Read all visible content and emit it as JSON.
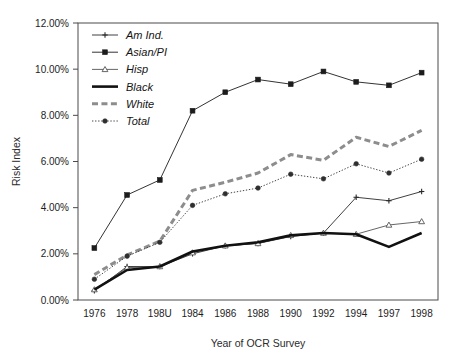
{
  "chart_data": {
    "type": "line",
    "title": "",
    "xlabel": "Year of OCR Survey",
    "ylabel": "Risk Index",
    "categories": [
      "1976",
      "1978",
      "198U",
      "1984",
      "1986",
      "1988",
      "1990",
      "1992",
      "1994",
      "1997",
      "1998"
    ],
    "ylim": [
      0,
      12
    ],
    "ytick_labels": [
      "0.00%",
      "2.00%",
      "4.00%",
      "6.00%",
      "8.00%",
      "10.00%",
      "12.00%"
    ],
    "ytick_values": [
      0,
      2,
      4,
      6,
      8,
      10,
      12
    ],
    "grid": false,
    "legend_position": "top-left",
    "value_unit": "percent",
    "series": [
      {
        "name": "Am Ind.",
        "values": [
          0.4,
          1.45,
          1.45,
          2.0,
          2.35,
          2.45,
          2.75,
          2.9,
          4.45,
          4.3,
          4.7
        ],
        "color": "#2a2a2a",
        "marker": "plus",
        "line_style": "solid",
        "line_width": 0.9
      },
      {
        "name": "Asian/PI",
        "values": [
          2.25,
          4.55,
          5.2,
          8.2,
          9.0,
          9.55,
          9.35,
          9.9,
          9.45,
          9.3,
          9.85
        ],
        "color": "#1c1c1c",
        "marker": "square",
        "line_style": "solid",
        "line_width": 0.9
      },
      {
        "name": "Hisp",
        "values": [
          0.45,
          1.4,
          1.45,
          2.05,
          2.35,
          2.45,
          2.8,
          2.9,
          2.85,
          3.25,
          3.4
        ],
        "color": "#555555",
        "marker": "triangle",
        "line_style": "solid",
        "line_width": 0.9
      },
      {
        "name": "Black",
        "values": [
          0.45,
          1.3,
          1.45,
          2.1,
          2.35,
          2.5,
          2.8,
          2.9,
          2.85,
          2.3,
          2.9
        ],
        "color": "#111111",
        "marker": "none",
        "line_style": "solid",
        "line_width": 2.6
      },
      {
        "name": "White",
        "values": [
          1.1,
          1.95,
          2.55,
          4.75,
          5.1,
          5.5,
          6.3,
          6.05,
          7.05,
          6.65,
          7.35
        ],
        "color": "#8d8d8d",
        "marker": "none",
        "line_style": "dashed",
        "line_width": 3.0
      },
      {
        "name": "Total",
        "values": [
          0.9,
          1.9,
          2.5,
          4.1,
          4.6,
          4.85,
          5.45,
          5.25,
          5.9,
          5.5,
          6.1
        ],
        "color": "#2f2f2f",
        "marker": "circle",
        "line_style": "dotted",
        "line_width": 0.9
      }
    ]
  }
}
